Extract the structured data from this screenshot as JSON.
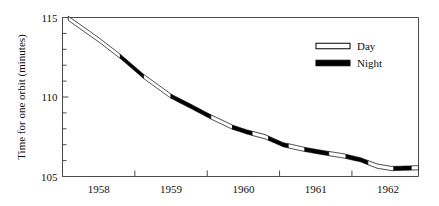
{
  "chart_data": {
    "type": "line",
    "title": "",
    "xlabel": "",
    "ylabel": "Time for one orbit (minutes)",
    "xlim": [
      1957.5,
      1962.42
    ],
    "ylim": [
      105,
      115
    ],
    "grid": false,
    "legend_position": "top-right",
    "x_tick_labels": [
      "1958",
      "1959",
      "1960",
      "1961",
      "1962"
    ],
    "x_tick_values": [
      1958,
      1959,
      1960,
      1961,
      1962
    ],
    "x_minor_tick_values": [
      1958.5,
      1959.5,
      1960.5,
      1961.5
    ],
    "y_tick_labels": [
      "115",
      "110",
      "105"
    ],
    "y_tick_values": [
      115,
      110,
      105
    ],
    "y_minor_tick_values": [
      114,
      113,
      112,
      111,
      109,
      108,
      107,
      106
    ],
    "series": [
      {
        "name": "Orbital period",
        "x": [
          1957.58,
          1958.0,
          1958.3,
          1958.62,
          1959.0,
          1959.3,
          1959.55,
          1959.85,
          1960.05,
          1960.3,
          1960.55,
          1960.85,
          1961.1,
          1961.38,
          1961.62,
          1961.85,
          1962.05,
          1962.42
        ],
        "y": [
          114.95,
          113.6,
          112.55,
          111.3,
          110.05,
          109.35,
          108.75,
          108.1,
          107.8,
          107.5,
          107.0,
          106.7,
          106.5,
          106.3,
          106.05,
          105.65,
          105.5,
          105.55
        ]
      }
    ],
    "segment_shading": [
      {
        "from_x": 1957.58,
        "to_x": 1958.3,
        "style": "Day"
      },
      {
        "from_x": 1958.3,
        "to_x": 1958.62,
        "style": "Night"
      },
      {
        "from_x": 1958.62,
        "to_x": 1959.0,
        "style": "Day"
      },
      {
        "from_x": 1959.0,
        "to_x": 1959.55,
        "style": "Night"
      },
      {
        "from_x": 1959.55,
        "to_x": 1959.85,
        "style": "Day"
      },
      {
        "from_x": 1959.85,
        "to_x": 1960.12,
        "style": "Night"
      },
      {
        "from_x": 1960.12,
        "to_x": 1960.35,
        "style": "Day"
      },
      {
        "from_x": 1960.35,
        "to_x": 1960.62,
        "style": "Night"
      },
      {
        "from_x": 1960.62,
        "to_x": 1960.85,
        "style": "Day"
      },
      {
        "from_x": 1960.85,
        "to_x": 1961.18,
        "style": "Night"
      },
      {
        "from_x": 1961.18,
        "to_x": 1961.42,
        "style": "Day"
      },
      {
        "from_x": 1961.42,
        "to_x": 1961.72,
        "style": "Night"
      },
      {
        "from_x": 1961.72,
        "to_x": 1962.08,
        "style": "Day"
      },
      {
        "from_x": 1962.08,
        "to_x": 1962.32,
        "style": "Night"
      },
      {
        "from_x": 1962.32,
        "to_x": 1962.42,
        "style": "Day"
      }
    ]
  },
  "legend": {
    "entries": [
      {
        "label": "Day",
        "swatch": "hollow",
        "fill": "#ffffff",
        "stroke": "#000000"
      },
      {
        "label": "Night",
        "swatch": "solid",
        "fill": "#000000",
        "stroke": "#000000"
      }
    ]
  },
  "colors": {
    "line_stroke": "#000000",
    "night_fill": "#000000",
    "day_fill": "#ffffff",
    "axis": "#4a4a4a",
    "background": "#ffffff",
    "text": "#111111"
  },
  "axes": {
    "y_title": "Time for one orbit (minutes)",
    "y_labels": [
      "115",
      "110",
      "105"
    ],
    "x_labels": [
      "1958",
      "1959",
      "1960",
      "1961",
      "1962"
    ]
  }
}
